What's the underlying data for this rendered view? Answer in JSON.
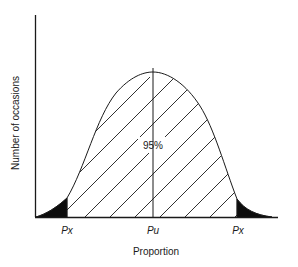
{
  "diagram": {
    "type": "normal-distribution-confidence-interval",
    "y_axis_label": "Number of occasions",
    "x_axis_label": "Proportion",
    "center_label": "95%",
    "tick_labels": [
      {
        "id": "left",
        "text": "Px"
      },
      {
        "id": "center",
        "text": "Pu"
      },
      {
        "id": "right",
        "text": "Px"
      }
    ],
    "shaded_region": "hatched central area",
    "tail_regions": "solid black tails",
    "colors": {
      "ink": "#1a1a1a",
      "background": "#ffffff"
    }
  }
}
